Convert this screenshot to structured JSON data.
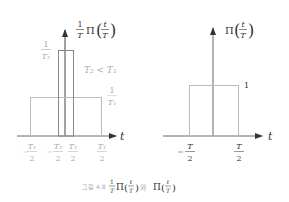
{
  "figure": {
    "caption_prefix": "그림 4.8",
    "caption_join": "와",
    "left_plot": {
      "title_frac_num": "1",
      "title_frac_den": "T",
      "title_func": "Π",
      "title_arg_num": "t",
      "title_arg_den": "T",
      "tall_level_num": "1",
      "tall_level_den": "T₂",
      "condition": "T₂ < T₁",
      "wide_level_num": "1",
      "wide_level_den": "T₁",
      "axis_label": "t",
      "ticks": [
        {
          "sign": "−",
          "num": "T₁",
          "den": "2"
        },
        {
          "sign": "−",
          "num": "T₂",
          "den": "2"
        },
        {
          "sign": "",
          "num": "T₂",
          "den": "2"
        },
        {
          "sign": "",
          "num": "T₁",
          "den": "2"
        }
      ]
    },
    "right_plot": {
      "title_func": "Π",
      "title_arg_num": "t",
      "title_arg_den": "T",
      "level": "1",
      "axis_label": "t",
      "ticks": [
        {
          "sign": "−",
          "num": "T",
          "den": "2"
        },
        {
          "sign": "",
          "num": "T",
          "den": "2"
        }
      ]
    }
  }
}
